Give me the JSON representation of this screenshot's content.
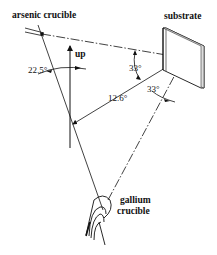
{
  "diagram": {
    "labels": {
      "arsenic": "arsenic crucible",
      "substrate": "substrate",
      "up": "up",
      "gallium_line1": "gallium",
      "gallium_line2": "crucible"
    },
    "angles": {
      "arsenic_tilt": "22.5°",
      "upper_substrate": "33°",
      "lower_substrate": "33°",
      "between_beams": "12.6°"
    },
    "colors": {
      "line": "#111111",
      "background": "#ffffff"
    }
  }
}
